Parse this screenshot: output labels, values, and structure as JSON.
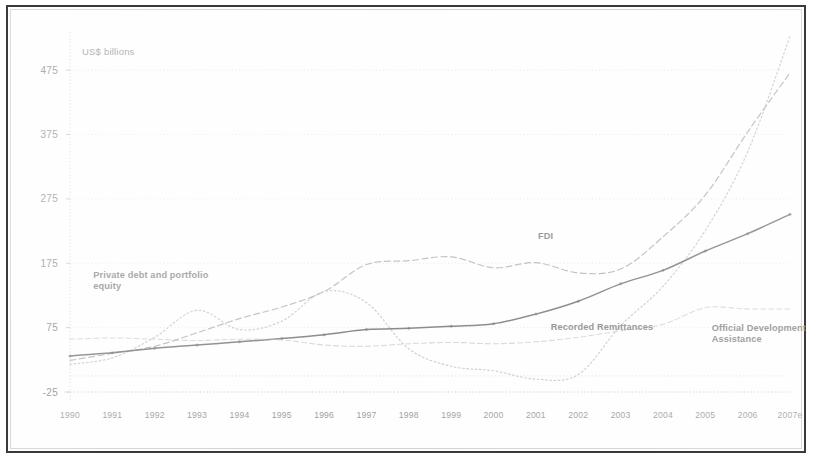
{
  "chart_data": {
    "type": "line",
    "title": "",
    "ylabel": "US$ billions",
    "xlabel": "",
    "grid": true,
    "legend_position": "inline-annotations",
    "ylim": [
      -25,
      525
    ],
    "yticks": [
      "-25",
      "75",
      "175",
      "275",
      "375",
      "475"
    ],
    "ytick_values": [
      -25,
      75,
      175,
      275,
      375,
      475
    ],
    "categories": [
      "1990",
      "1991",
      "1992",
      "1993",
      "1994",
      "1995",
      "1996",
      "1997",
      "1998",
      "1999",
      "2000",
      "2001",
      "2002",
      "2003",
      "2004",
      "2005",
      "2006",
      "2007e"
    ],
    "series": [
      {
        "name": "FDI",
        "style": "dashed",
        "color": "#a8a8a8",
        "values": [
          24,
          35,
          46,
          67,
          89,
          107,
          131,
          173,
          179,
          185,
          168,
          176,
          160,
          166,
          216,
          281,
          379,
          471
        ]
      },
      {
        "name": "Private debt and portfolio equity",
        "style": "dotted",
        "color": "#b4b4b4",
        "values": [
          18,
          28,
          60,
          102,
          72,
          85,
          131,
          114,
          42,
          15,
          8,
          -5,
          2,
          78,
          139,
          226,
          348,
          528
        ]
      },
      {
        "name": "Recorded Remittances",
        "style": "solid",
        "color": "#757575",
        "values": [
          31,
          36,
          43,
          48,
          53,
          58,
          64,
          72,
          74,
          77,
          81,
          96,
          116,
          143,
          164,
          194,
          221,
          251
        ]
      },
      {
        "name": "Official Development Assistance",
        "style": "dashed-light",
        "color": "#bdbdbd",
        "values": [
          57,
          59,
          57,
          55,
          57,
          56,
          48,
          46,
          50,
          52,
          50,
          53,
          60,
          70,
          80,
          106,
          104,
          104
        ]
      }
    ],
    "annotations": [
      {
        "name": "fdi-label",
        "text": "FDI",
        "x": 2001.05,
        "y": 213
      },
      {
        "name": "private-debt-label",
        "line1": "Private debt and portfolio",
        "line2": "equity",
        "x": 1990.55,
        "y": 152
      },
      {
        "name": "remittances-label",
        "text": "Recorded Remittances",
        "x": 2001.35,
        "y": 72
      },
      {
        "name": "oda-label",
        "line1": "Official Development",
        "line2": "Assistance",
        "x": 2005.15,
        "y": 70
      }
    ]
  },
  "axis": {
    "y_unit_caption": "US$ billions"
  }
}
